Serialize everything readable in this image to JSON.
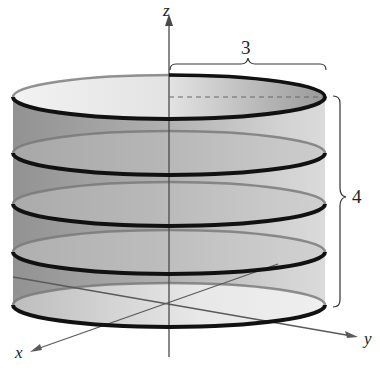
{
  "figure": {
    "axes": {
      "x_label": "x",
      "y_label": "y",
      "z_label": "z"
    },
    "dimensions": {
      "radius_label": "3",
      "height_label": "4"
    },
    "colors": {
      "surface_dark": "#8e8e8e",
      "surface_light": "#d8d8d8",
      "ring": "#111111",
      "axis": "#555555"
    },
    "ring_count": 5
  }
}
